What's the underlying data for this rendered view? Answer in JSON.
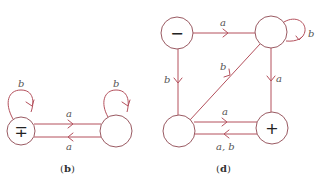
{
  "colors": {
    "edge": "#b4505c",
    "node_stroke": "#9a5a62",
    "label": "#555555"
  },
  "diagram_b": {
    "caption": "b",
    "nodes": [
      {
        "id": "b0",
        "marker": "∓",
        "start": true,
        "accept": true
      },
      {
        "id": "b1",
        "marker": ""
      }
    ],
    "edges": [
      {
        "from": "b0",
        "to": "b0",
        "label": "b"
      },
      {
        "from": "b1",
        "to": "b1",
        "label": "b"
      },
      {
        "from": "b0",
        "to": "b1",
        "label": "a"
      },
      {
        "from": "b1",
        "to": "b0",
        "label": "a"
      }
    ]
  },
  "diagram_d": {
    "caption": "d",
    "nodes": [
      {
        "id": "d0",
        "marker": "−",
        "start": true
      },
      {
        "id": "d1",
        "marker": ""
      },
      {
        "id": "d2",
        "marker": ""
      },
      {
        "id": "d3",
        "marker": "+",
        "accept": true
      }
    ],
    "edges": [
      {
        "from": "d0",
        "to": "d1",
        "label": "a"
      },
      {
        "from": "d1",
        "to": "d1",
        "label": "b"
      },
      {
        "from": "d0",
        "to": "d2",
        "label": "b"
      },
      {
        "from": "d1",
        "to": "d3",
        "label": "a"
      },
      {
        "from": "d2",
        "to": "d1",
        "label": "b"
      },
      {
        "from": "d2",
        "to": "d3",
        "label": "a"
      },
      {
        "from": "d3",
        "to": "d2",
        "label": "a, b"
      }
    ]
  }
}
